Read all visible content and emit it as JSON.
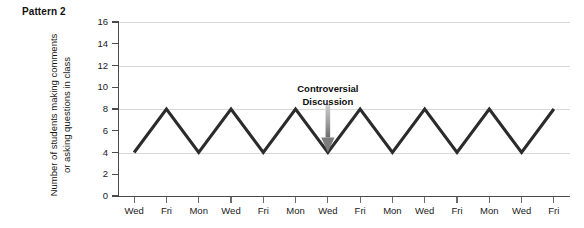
{
  "figure": {
    "pattern_label": "Pattern 2"
  },
  "chart_data": {
    "type": "line",
    "title": "Pattern 2",
    "xlabel": "",
    "ylabel": "Number of students making comments or asking questions in class",
    "ylabel_lines": [
      "Number of students making comments",
      "or asking questions in class"
    ],
    "categories": [
      "Wed",
      "Fri",
      "Mon",
      "Wed",
      "Fri",
      "Mon",
      "Wed",
      "Fri",
      "Mon",
      "Wed",
      "Fri",
      "Mon",
      "Wed",
      "Fri"
    ],
    "values": [
      4,
      8,
      4,
      8,
      4,
      8,
      4,
      8,
      4,
      8,
      4,
      8,
      4,
      8
    ],
    "ylim": [
      0,
      16
    ],
    "ytick_values": [
      0,
      2,
      4,
      6,
      8,
      10,
      12,
      14,
      16
    ],
    "ytick_labels": [
      "0",
      "2",
      "4",
      "6",
      "8",
      "10",
      "12",
      "14",
      "16"
    ],
    "gridlines_at": [
      4,
      8,
      12,
      16
    ],
    "grid": true,
    "legend": "none",
    "line_color": "#2b2b2b",
    "annotations": [
      {
        "text_lines": [
          "Controversial",
          "Discussion"
        ],
        "points_at_category_index": 6,
        "points_at_value": 4,
        "arrow_color": "#8c8c8c"
      }
    ]
  }
}
